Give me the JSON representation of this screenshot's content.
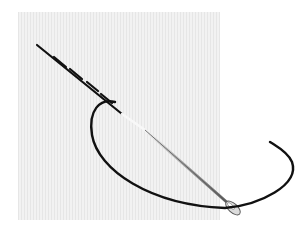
{
  "illustration": {
    "subject": "needle sewing a running stitch through fabric",
    "colors": {
      "background": "#ffffff",
      "fabric": "#f1f1f1",
      "fabric_weave": "#e4e4e4",
      "thread": "#111111",
      "needle_dark": "#6e6e6e",
      "needle_light": "#e8e8e8"
    }
  }
}
